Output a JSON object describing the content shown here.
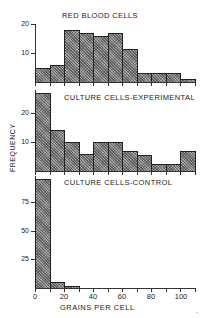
{
  "chart_data": [
    {
      "type": "bar",
      "title": "RED BLOOD CELLS",
      "xlabel": "GRAINS PER CELL",
      "ylabel": "FREQUENCY",
      "bin_width": 10,
      "categories": [
        "0-10",
        "10-20",
        "20-30",
        "30-40",
        "40-50",
        "50-60",
        "60-70",
        "70-80",
        "80-90",
        "90-100",
        "100-110"
      ],
      "values": [
        5,
        6,
        18,
        17,
        16,
        17,
        11.5,
        3,
        3,
        3,
        1
      ],
      "yticks": [
        10,
        20
      ],
      "ylim": [
        0,
        21
      ],
      "grid": false
    },
    {
      "type": "bar",
      "title": "CULTURE CELLS-EXPERIMENTAL",
      "xlabel": "GRAINS PER CELL",
      "ylabel": "FREQUENCY",
      "bin_width": 10,
      "categories": [
        "0-10",
        "10-20",
        "20-30",
        "30-40",
        "40-50",
        "50-60",
        "60-70",
        "70-80",
        "80-90",
        "90-100",
        "100-110"
      ],
      "values": [
        27,
        14,
        10,
        6,
        10,
        10,
        7,
        5.5,
        2.5,
        2.5,
        7
      ],
      "yticks": [
        10,
        20
      ],
      "ylim": [
        0,
        28
      ],
      "grid": false
    },
    {
      "type": "bar",
      "title": "CULTURE CELLS-CONTROL",
      "xlabel": "GRAINS PER CELL",
      "ylabel": "FREQUENCY",
      "bin_width": 10,
      "categories": [
        "0-10",
        "10-20",
        "20-30",
        "30-40",
        "40-50",
        "50-60",
        "60-70",
        "70-80",
        "80-90",
        "90-100",
        "100-110"
      ],
      "values": [
        95,
        5,
        1.5,
        0,
        0,
        0,
        0,
        0,
        0,
        0,
        0
      ],
      "yticks": [
        25,
        50,
        75
      ],
      "ylim": [
        0,
        96
      ],
      "xticks": [
        0,
        20,
        40,
        60,
        80,
        100
      ],
      "xlim": [
        0,
        110
      ],
      "grid": false
    }
  ],
  "labels": {
    "panel1_title": "RED BLOOD CELLS",
    "panel2_title": "CULTURE CELLS-EXPERIMENTAL",
    "panel3_title": "CULTURE CELLS-CONTROL",
    "ylabel": "FREQUENCY",
    "xlabel": "GRAINS PER CELL",
    "p1_y": [
      "10",
      "20"
    ],
    "p2_y": [
      "10",
      "20"
    ],
    "p3_y": [
      "25",
      "50",
      "75"
    ],
    "x": [
      "0",
      "20",
      "40",
      "60",
      "80",
      "100"
    ]
  },
  "colors": {
    "bar_fill": "#8a8a8a",
    "axis": "#333333",
    "background": "#ffffff"
  }
}
